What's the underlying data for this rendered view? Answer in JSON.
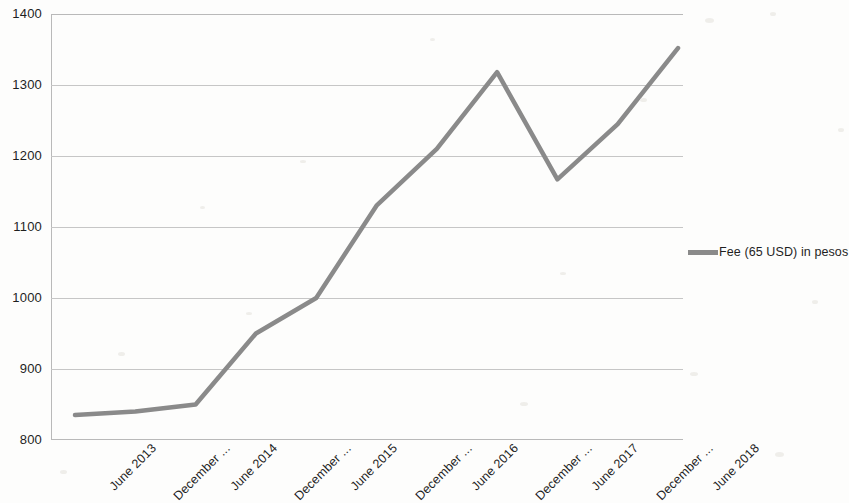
{
  "chart_data": {
    "type": "line",
    "title": "",
    "xlabel": "",
    "ylabel": "",
    "ylim": [
      800,
      1400
    ],
    "y_ticks": [
      1400,
      1300,
      1200,
      1100,
      1000,
      900,
      800
    ],
    "grid": true,
    "legend_position": "right",
    "line_color": "#8a8a8a",
    "grid_color": "#c6c6c6",
    "axis_color": "#b9b9b9",
    "categories": [
      "June 2013",
      "December ...",
      "June 2014",
      "December ...",
      "June 2015",
      "December ...",
      "June 2016",
      "December ...",
      "June 2017",
      "December ...",
      "June 2018"
    ],
    "series": [
      {
        "name": "Fee (65 USD) in pesos",
        "values": [
          835,
          840,
          850,
          950,
          1000,
          1130,
          1210,
          1318,
          1167,
          1245,
          1352
        ]
      }
    ]
  },
  "legend": {
    "entries": [
      {
        "label": "Fee (65 USD) in pesos",
        "color": "#8a8a8a",
        "marker": "line-swatch"
      }
    ]
  }
}
